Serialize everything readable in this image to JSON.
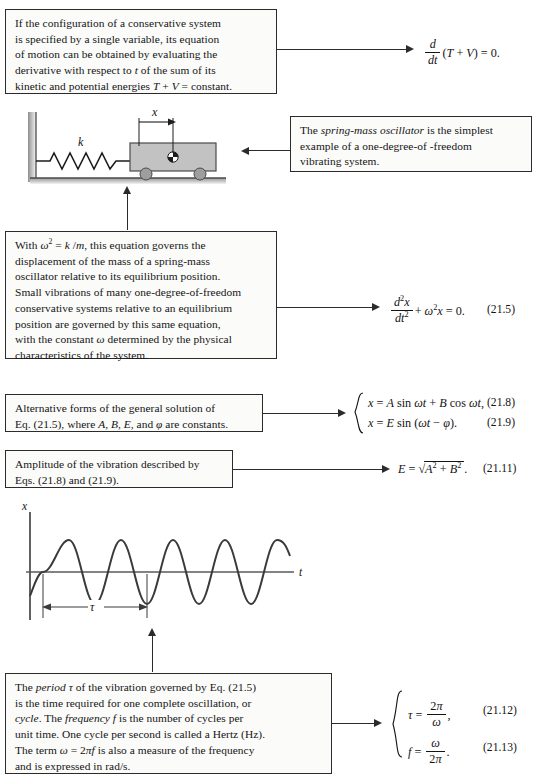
{
  "page": {
    "type": "textbook-summary-page",
    "topic": "Vibrations — spring-mass oscillator",
    "background": "#ffffff",
    "ink": "#2b2b2b"
  },
  "callouts": [
    {
      "id": "conservative-system",
      "text": "If the configuration of a conservative system is specified by a single variable, its equation of motion can be obtained by evaluating the derivative with respect to t of the sum of its kinetic and potential energies T + V = constant.",
      "lines": [
        "If the configuration of a conservative system",
        "is specified by a single variable, its equation",
        "of motion can be obtained by evaluating the",
        "derivative with respect to t of the sum of its",
        "kinetic and potential energies T + V = constant."
      ]
    },
    {
      "id": "spring-mass-oscillator",
      "text": "The spring-mass oscillator is the simplest example of a one-degree-of -freedom vibrating system.",
      "lines": [
        "The spring-mass oscillator is the simplest",
        "example of a one-degree-of -freedom",
        "vibrating system."
      ],
      "italic_phrase": "spring-mass oscillator"
    },
    {
      "id": "governing-equation",
      "text": "With ω² = k /m, this equation governs the displacement of the mass of a spring-mass oscillator relative to its equilibrium position. Small vibrations of many one-degree-of-freedom conservative systems relative to an equilibrium position are governed by this same equation, with the constant ω determined by the physical characteristics of the system.",
      "lines": [
        "With ω² = k /m, this equation governs the",
        "displacement of the mass of a spring-mass",
        "oscillator relative to its equilibrium position.",
        "Small vibrations of many one-degree-of-freedom",
        "conservative systems relative to an equilibrium",
        "position are governed by this same equation,",
        "with the constant ω determined by the physical",
        "characteristics of the system."
      ]
    },
    {
      "id": "alternative-forms",
      "text": "Alternative forms of the general solution of Eq. (21.5), where A, B, E, and ϕ are constants.",
      "lines": [
        "Alternative forms of the general solution of",
        "Eq. (21.5), where A, B, E, and ϕ are constants."
      ]
    },
    {
      "id": "amplitude",
      "text": "Amplitude of the vibration described by Eqs. (21.8) and (21.9).",
      "lines": [
        "Amplitude of the vibration described by",
        "Eqs. (21.8) and (21.9)."
      ]
    },
    {
      "id": "period-frequency",
      "text": "The period τ of the vibration governed by Eq. (21.5) is the time required for one complete oscillation, or cycle. The frequency f is the number of cycles per unit time. One cycle per second is called a Hertz (Hz). The term ω = 2πf is also a measure of the frequency and is expressed in rad/s.",
      "lines": [
        "The period τ of the vibration governed by Eq. (21.5)",
        "is the time required for one complete oscillation, or",
        "cycle. The frequency f is the number of cycles per",
        "unit time. One cycle per second is called a Hertz (Hz).",
        "The term ω = 2πf is also a measure of the frequency",
        "and is expressed in rad/s."
      ],
      "italic_phrases": [
        "period",
        "cycle",
        "frequency"
      ]
    }
  ],
  "equations": [
    {
      "id": "eq-energy-derivative",
      "latex_like": "d/dt (T + V) = 0.",
      "number": "",
      "parts": {
        "num": "d",
        "den": "dt",
        "rest": "(T + V) = 0."
      }
    },
    {
      "id": "eq-21-5",
      "latex_like": "d²x/dt² + ω²x = 0.",
      "number": "(21.5)",
      "parts": {
        "num": "d²x",
        "den": "dt²",
        "rest": "+ ω²x = 0."
      }
    },
    {
      "id": "eq-21-8",
      "latex_like": "x = A sin ωt + B cos ωt,",
      "number": "(21.8)"
    },
    {
      "id": "eq-21-9",
      "latex_like": "x = E sin (ωt − ϕ).",
      "number": "(21.9)"
    },
    {
      "id": "eq-21-11",
      "latex_like": "E = √(A² + B²).",
      "number": "(21.11)"
    },
    {
      "id": "eq-21-12",
      "latex_like": "τ = 2π/ω,",
      "number": "(21.12)",
      "parts": {
        "lhs": "τ =",
        "num": "2π",
        "den": "ω",
        "tail": ","
      }
    },
    {
      "id": "eq-21-13",
      "latex_like": "f = ω/2π.",
      "number": "(21.13)",
      "parts": {
        "lhs": "f =",
        "num": "ω",
        "den": "2π",
        "tail": "."
      }
    }
  ],
  "figures": {
    "spring_mass": {
      "id": "spring-mass-diagram",
      "labels": {
        "spring_constant": "k",
        "displacement": "x"
      },
      "elements": [
        "wall",
        "spring",
        "block",
        "wheel-left",
        "wheel-right",
        "ground",
        "center-of-mass-symbol",
        "displacement-arrow"
      ]
    },
    "waveform": {
      "id": "vibration-waveform",
      "axis_labels": {
        "vertical": "x",
        "horizontal": "t"
      },
      "period_label": "τ",
      "cycles_shown": 3,
      "description": "sinusoidal displacement versus time with one period marked"
    }
  }
}
